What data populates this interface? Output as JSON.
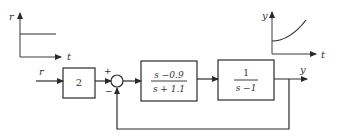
{
  "input_plot": {
    "y_label": "r",
    "x_label": "t",
    "shape": "step"
  },
  "output_plot": {
    "y_label": "y",
    "x_label": "t",
    "shape": "exponential-growth"
  },
  "diagram": {
    "input_label": "r",
    "gain_block": {
      "value": "2"
    },
    "summing_junction": {
      "plus_sign": "+",
      "minus_sign": "−"
    },
    "controller_block": {
      "numerator": "s −0.9",
      "denominator": "s + 1.1"
    },
    "plant_block": {
      "numerator": "1",
      "denominator": "s −1"
    },
    "output_label": "y",
    "feedback": "unity negative feedback"
  }
}
